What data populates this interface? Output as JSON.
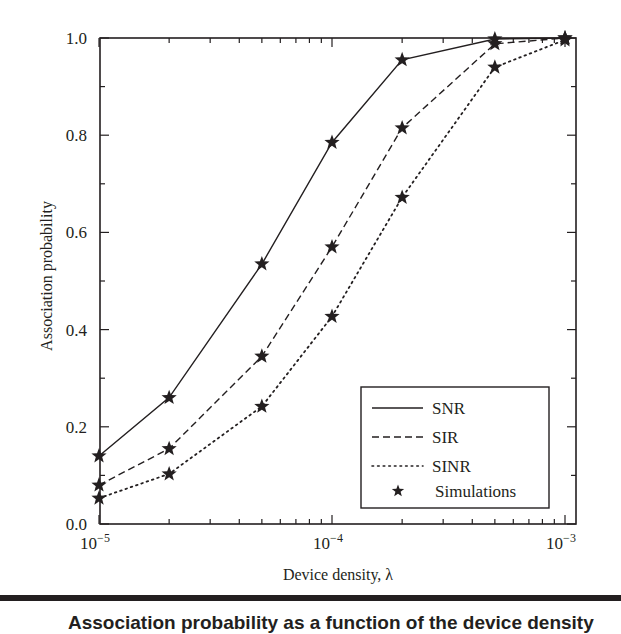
{
  "chart_data": {
    "type": "line",
    "title": "",
    "xlabel": "Device density, λ",
    "ylabel": "Association probability",
    "xscale": "log",
    "xlim": [
      1e-05,
      0.0011
    ],
    "ylim": [
      0.0,
      1.0
    ],
    "x": [
      1e-05,
      2e-05,
      5e-05,
      0.0001,
      0.0002,
      0.0005,
      0.001
    ],
    "x_tick_labels": [
      {
        "base": "10",
        "exp": "−5",
        "value": 1e-05
      },
      {
        "base": "10",
        "exp": "−4",
        "value": 0.0001
      },
      {
        "base": "10",
        "exp": "−3",
        "value": 0.001
      }
    ],
    "y_ticks": [
      0.0,
      0.2,
      0.4,
      0.6,
      0.8,
      1.0
    ],
    "y_tick_labels": [
      "0.0",
      "0.2",
      "0.4",
      "0.6",
      "0.8",
      "1.0"
    ],
    "grid": false,
    "legend_position": "lower right",
    "series": [
      {
        "name": "SNR",
        "style": "solid",
        "values": [
          0.14,
          0.26,
          0.535,
          0.785,
          0.955,
          0.998,
          1.0
        ]
      },
      {
        "name": "SIR",
        "style": "dashed",
        "values": [
          0.08,
          0.155,
          0.345,
          0.57,
          0.815,
          0.988,
          1.0
        ]
      },
      {
        "name": "SINR",
        "style": "dotted",
        "values": [
          0.053,
          0.103,
          0.242,
          0.427,
          0.672,
          0.94,
          0.996
        ]
      }
    ],
    "markers": {
      "name": "Simulations",
      "symbol": "star"
    },
    "legend": [
      "SNR",
      "SIR",
      "SINR",
      "Simulations"
    ]
  },
  "caption": "Association probability as a function of the device density",
  "colors": {
    "ink": "#231f20",
    "background": "#ffffff"
  }
}
